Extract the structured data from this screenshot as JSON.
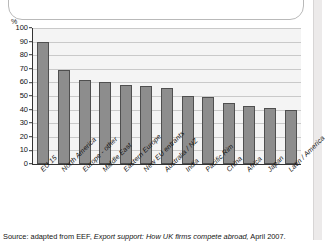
{
  "axis": {
    "y_unit_label": "%",
    "y_ticks": [
      "100",
      "90",
      "80",
      "70",
      "60",
      "50",
      "40",
      "30",
      "20",
      "10",
      "0"
    ]
  },
  "source": {
    "prefix": "Source: adapted from EEF,",
    "title": "Export support: How UK firms compete abroad,",
    "suffix": "April 2007."
  },
  "colors": {
    "bar_fill": "#8d8d8d",
    "bar_stroke": "#4f4f4f",
    "plot_background": "#f4f4f4",
    "gridline": "#c9c9c9",
    "axis": "#333333"
  },
  "chart_data": {
    "type": "bar",
    "title": "",
    "xlabel": "",
    "ylabel": "%",
    "ylim": [
      0,
      100
    ],
    "ytick_step": 10,
    "grid": true,
    "legend": "none",
    "categories": [
      "EU 15",
      "North America",
      "Europe - other",
      "Middle East",
      "Eastern Europe",
      "New EU entrants",
      "Australia / NZ",
      "India",
      "Pacific Rim",
      "China",
      "Africa",
      "Japan",
      "Latin / America"
    ],
    "values": [
      90,
      69,
      62,
      60,
      58,
      57.5,
      56,
      50,
      49,
      45,
      42.5,
      41.5,
      39.5
    ]
  }
}
